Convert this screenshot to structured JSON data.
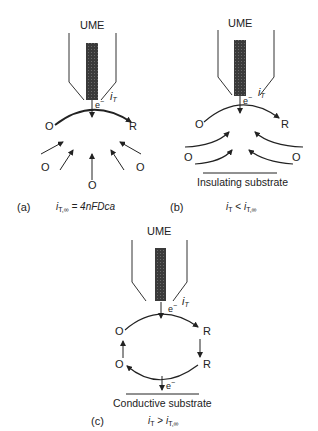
{
  "figure": {
    "panels": [
      {
        "id": "a",
        "tag": "(a)",
        "electrode_label": "UME",
        "current_label": "i",
        "current_sub": "T",
        "electron_label": "e",
        "electron_sup": "−",
        "species_oxidized": "O",
        "species_reduced": "R",
        "equation_lhs": "i",
        "equation_lhs_sub": "T,∞",
        "equation_rhs": " = 4nFDca"
      },
      {
        "id": "b",
        "tag": "(b)",
        "electrode_label": "UME",
        "current_label": "i",
        "current_sub": "T",
        "electron_label": "e",
        "electron_sup": "−",
        "species_oxidized": "O",
        "species_reduced": "R",
        "substrate_label": "Insulating substrate",
        "equation_lhs": "i",
        "equation_lhs_sub": "T",
        "equation_op": " < ",
        "equation_rhs": "i",
        "equation_rhs_sub": "T,∞"
      },
      {
        "id": "c",
        "tag": "(c)",
        "electrode_label": "UME",
        "current_label": "i",
        "current_sub": "T",
        "electron_label": "e",
        "electron_sup": "−",
        "species_oxidized": "O",
        "species_reduced": "R",
        "substrate_label": "Conductive substrate",
        "equation_lhs": "i",
        "equation_lhs_sub": "T",
        "equation_op": " > ",
        "equation_rhs": "i",
        "equation_rhs_sub": "T,∞"
      }
    ]
  }
}
